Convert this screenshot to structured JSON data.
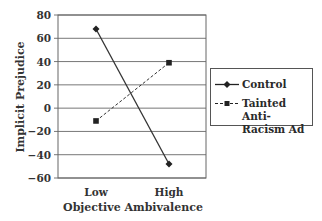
{
  "chart_data": {
    "type": "line",
    "title": "",
    "xlabel": "Objective Ambivalence",
    "ylabel": "Implicit Prejudice",
    "categories": [
      "Low",
      "High"
    ],
    "ylim": [
      -60,
      80
    ],
    "yticks": [
      80,
      60,
      40,
      20,
      0,
      -20,
      -40,
      -60
    ],
    "ytick_labels": [
      "80",
      "60",
      "40",
      "20",
      "0",
      "−20",
      "−40",
      "−60"
    ],
    "grid": true,
    "legend_position": "right",
    "series": [
      {
        "name": "Control",
        "values": [
          68,
          -48
        ],
        "style": "solid",
        "marker": "diamond",
        "color": "#333333"
      },
      {
        "name": "Tainted Anti-Racism Ad",
        "values": [
          -11,
          39
        ],
        "style": "dashed",
        "marker": "square",
        "color": "#333333"
      }
    ]
  },
  "legend": {
    "items": [
      {
        "line1": "Control",
        "line2": ""
      },
      {
        "line1": "Tainted Anti-",
        "line2": "Racism Ad"
      }
    ]
  },
  "axes": {
    "x_tick_low": "Low",
    "x_tick_high": "High",
    "x_title": "Objective Ambivalence",
    "y_title": "Implicit Prejudice"
  }
}
